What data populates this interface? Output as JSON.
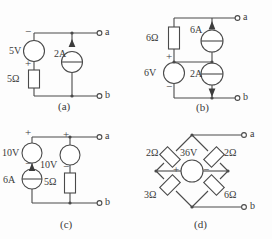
{
  "figure": {
    "background": "#fdfdfd",
    "line_color": "#4a4a4a",
    "text_color": "#3a3a3a"
  },
  "circuits": [
    {
      "id": "a",
      "caption": "(a)",
      "terminals": [
        {
          "name": "a",
          "label": "a"
        },
        {
          "name": "b",
          "label": "b"
        }
      ],
      "elements": [
        {
          "name": "voltage-source-5v",
          "type": "voltage-source",
          "label": "5V",
          "polarity_top": "−",
          "polarity_bottom": "+"
        },
        {
          "name": "resistor-5ohm",
          "type": "resistor",
          "label": "5Ω"
        },
        {
          "name": "current-source-2a",
          "type": "current-source",
          "label": "2A",
          "arrow_direction": "up"
        }
      ]
    },
    {
      "id": "b",
      "caption": "(b)",
      "terminals": [
        {
          "name": "a",
          "label": "a"
        },
        {
          "name": "b",
          "label": "b"
        }
      ],
      "elements": [
        {
          "name": "resistor-6ohm",
          "type": "resistor",
          "label": "6Ω"
        },
        {
          "name": "voltage-source-6v",
          "type": "voltage-source",
          "label": "6V",
          "polarity_top": "+",
          "polarity_bottom": "−"
        },
        {
          "name": "current-source-6a",
          "type": "current-source",
          "label": "6A",
          "arrow_direction": "up"
        },
        {
          "name": "current-source-2a",
          "type": "current-source",
          "label": "2A",
          "arrow_direction": "down"
        }
      ]
    },
    {
      "id": "c",
      "caption": "(c)",
      "terminals": [
        {
          "name": "a",
          "label": "a"
        },
        {
          "name": "b",
          "label": "b"
        }
      ],
      "elements": [
        {
          "name": "voltage-source-10v-left",
          "type": "voltage-source",
          "label": "10V",
          "polarity_top": "+",
          "polarity_bottom": "−"
        },
        {
          "name": "current-source-6a",
          "type": "current-source",
          "label": "6A",
          "arrow_direction": "up"
        },
        {
          "name": "voltage-source-10v-right",
          "type": "voltage-source",
          "label": "10V",
          "polarity_top": "+",
          "polarity_bottom": "−"
        },
        {
          "name": "resistor-5ohm",
          "type": "resistor",
          "label": "5Ω"
        }
      ]
    },
    {
      "id": "d",
      "caption": "(d)",
      "terminals": [
        {
          "name": "a",
          "label": "a"
        },
        {
          "name": "b",
          "label": "b"
        }
      ],
      "elements": [
        {
          "name": "resistor-2ohm-top-left",
          "type": "resistor",
          "label": "2Ω"
        },
        {
          "name": "resistor-2ohm-top-right",
          "type": "resistor",
          "label": "2Ω"
        },
        {
          "name": "resistor-3ohm-bottom-left",
          "type": "resistor",
          "label": "3Ω"
        },
        {
          "name": "resistor-6ohm-bottom-right",
          "type": "resistor",
          "label": "6Ω"
        },
        {
          "name": "voltage-source-36v",
          "type": "voltage-source",
          "label": "36V",
          "polarity_left": "+",
          "polarity_right": "−"
        }
      ]
    }
  ]
}
